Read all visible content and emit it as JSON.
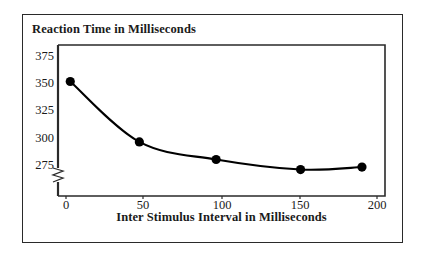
{
  "chart_data": {
    "type": "line",
    "title": "Reaction Time in Milliseconds",
    "xlabel": "Inter Stimulus Interval in Milliseconds",
    "ylabel": "Reaction Time in Milliseconds",
    "x": [
      0,
      45,
      95,
      150,
      190
    ],
    "values": [
      353,
      305,
      291,
      283,
      285
    ],
    "series": [
      {
        "name": "Reaction Time",
        "x": [
          0,
          45,
          95,
          150,
          190
        ],
        "values": [
          353,
          305,
          291,
          283,
          285
        ]
      }
    ],
    "xlim": [
      -8,
      205
    ],
    "ylim": [
      262,
      382
    ],
    "xticks": [
      0,
      50,
      100,
      150,
      200
    ],
    "xtick_labels": [
      "0",
      "50",
      "100",
      "150",
      "200"
    ],
    "yticks": [
      275,
      300,
      325,
      350,
      375
    ],
    "ytick_labels": [
      "275",
      "300",
      "325",
      "350",
      "375"
    ],
    "grid": false,
    "legend": false,
    "legend_position": "none",
    "axis_break": true,
    "axis_break_note": "zigzag break on y-axis below 275",
    "marker": "filled-circle",
    "line_color": "#000000",
    "marker_color": "#000000",
    "frame_color": "#2a2a2a",
    "background_color": "#ffffff"
  },
  "figure": {
    "title": "Reaction Time in Milliseconds",
    "xaxis_title": "Inter Stimulus Interval in Milliseconds"
  }
}
